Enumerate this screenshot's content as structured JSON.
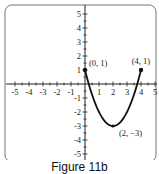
{
  "chart_data": {
    "type": "line",
    "title": "",
    "caption": "Figure 11b",
    "xlabel": "",
    "ylabel": "",
    "xlim": [
      -5,
      5
    ],
    "ylim": [
      -5,
      5
    ],
    "grid": false,
    "x_ticks": [
      -5,
      -4,
      -3,
      -2,
      -1,
      1,
      2,
      3,
      4,
      5
    ],
    "y_ticks": [
      5,
      4,
      3,
      2,
      1,
      -1,
      -2,
      -3,
      -4,
      -5
    ],
    "series": [
      {
        "name": "parabola segment",
        "description": "Upward-opening parabola y = (x-2)^2 - 3 on domain [0, 4] with closed endpoints",
        "x": [
          0,
          0.5,
          1,
          1.5,
          2,
          2.5,
          3,
          3.5,
          4
        ],
        "y": [
          1,
          -0.75,
          -2,
          -2.75,
          -3,
          -2.75,
          -2,
          -0.75,
          1
        ],
        "color": "#111111"
      }
    ],
    "annotations": [
      {
        "label": "(0, 1)",
        "x": 0,
        "y": 1,
        "marker": "closed-dot"
      },
      {
        "label": "(4, 1)",
        "x": 4,
        "y": 1,
        "marker": "closed-dot"
      },
      {
        "label": "(2, −3)",
        "x": 2,
        "y": -3,
        "marker": "vertex-dot"
      }
    ]
  },
  "labels": {
    "caption": "Figure 11b",
    "p0": "(0, 1)",
    "p1": "(4, 1)",
    "vertex": "(2, −3)"
  }
}
